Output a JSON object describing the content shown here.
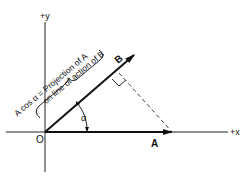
{
  "diagram": {
    "axes": {
      "x_label": "+x",
      "y_label": "+y",
      "origin_label": "O"
    },
    "vectors": {
      "a_label": "A",
      "b_label": "B"
    },
    "angle_label": "α",
    "annotation_line1": "A cos α = Projection of A",
    "annotation_line2": "on line of action of B",
    "colors": {
      "ink": "#111111",
      "background": "#ffffff",
      "dashed": "#444444"
    }
  }
}
